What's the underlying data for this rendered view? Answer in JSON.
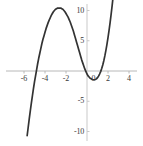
{
  "chart_data": {
    "type": "line",
    "title": "",
    "subtitle": "",
    "xlabel": "",
    "ylabel": "",
    "xlim": [
      -6.6,
      4.6
    ],
    "ylim": [
      -11.0,
      10.9
    ],
    "grid": false,
    "legend": null,
    "axis_style": {
      "x_axis_color": "#b8b8b8",
      "y_axis_color": "#c8c8c8",
      "curve_color": "#333333",
      "tick_label_color": "#3a3a3a",
      "background": "#ffffff"
    },
    "xticks": [
      -6,
      -4,
      -2,
      0,
      2,
      4
    ],
    "xtick_labels": [
      "-6",
      "-4",
      "-2",
      "0",
      "2",
      "4"
    ],
    "yticks": [
      10,
      5,
      0,
      -5,
      -10
    ],
    "ytick_labels": [
      "10",
      "5",
      "0",
      "-5",
      "-10"
    ],
    "origin_label": "0",
    "annotations": [],
    "series": [
      {
        "name": "curve",
        "color": "#333333",
        "linewidth": 1.6,
        "x": [
          -5.7,
          -5.6,
          -5.5,
          -5.4,
          -5.3,
          -5.2,
          -5.1,
          -5.0,
          -4.9,
          -4.8,
          -4.7,
          -4.6,
          -4.5,
          -4.4,
          -4.3,
          -4.2,
          -4.1,
          -4.0,
          -3.9,
          -3.8,
          -3.7,
          -3.6,
          -3.5,
          -3.4,
          -3.3,
          -3.2,
          -3.1,
          -3.0,
          -2.9,
          -2.8,
          -2.7,
          -2.6,
          -2.5,
          -2.4,
          -2.3,
          -2.2,
          -2.1,
          -2.0,
          -1.9,
          -1.8,
          -1.7,
          -1.6,
          -1.5,
          -1.4,
          -1.3,
          -1.2,
          -1.1,
          -1.0,
          -0.9,
          -0.8,
          -0.7,
          -0.6,
          -0.5,
          -0.4,
          -0.3,
          -0.2,
          -0.1,
          0.0,
          0.1,
          0.2,
          0.3,
          0.4,
          0.5,
          0.6,
          0.7,
          0.8,
          0.9,
          1.0,
          1.1,
          1.2,
          1.3,
          1.4,
          1.5,
          1.6,
          1.7,
          1.8,
          1.9,
          2.0,
          2.1,
          2.2,
          2.3,
          2.4,
          2.5,
          2.6,
          2.7,
          2.8,
          2.9,
          3.0,
          3.05
        ],
        "y": [
          -10.7,
          -9.3,
          -7.9,
          -6.6,
          -5.3,
          -4.1,
          -2.9,
          -1.8,
          -0.8,
          0.2,
          1.2,
          2.1,
          2.9,
          3.7,
          4.5,
          5.2,
          5.8,
          6.4,
          7.0,
          7.5,
          8.0,
          8.4,
          8.8,
          9.2,
          9.5,
          9.8,
          10.0,
          10.2,
          10.3,
          10.4,
          10.4,
          10.4,
          10.4,
          10.3,
          10.2,
          10.0,
          9.8,
          9.5,
          9.2,
          8.9,
          8.5,
          8.1,
          7.6,
          7.1,
          6.6,
          6.0,
          5.4,
          4.8,
          4.2,
          3.6,
          3.0,
          2.4,
          1.8,
          1.3,
          0.8,
          0.3,
          -0.1,
          -0.5,
          -0.8,
          -1.0,
          -1.2,
          -1.3,
          -1.4,
          -1.45,
          -1.45,
          -1.4,
          -1.3,
          -1.1,
          -0.85,
          -0.5,
          -0.1,
          0.4,
          1.0,
          1.7,
          2.5,
          3.4,
          4.4,
          5.5,
          6.7,
          8.0,
          9.4,
          10.9,
          12.5,
          14.2,
          16.0,
          17.9,
          19.9,
          22.0,
          23.1
        ]
      }
    ],
    "features": {
      "local_maximum": {
        "x": -2.7,
        "y": 10.4
      },
      "local_minimum": {
        "x": 0.65,
        "y": -1.45
      },
      "x_intercepts": [
        -4.8,
        -0.15,
        1.3
      ]
    }
  },
  "figure": {
    "width_px": 143,
    "height_px": 146,
    "plot_origin_px": {
      "x": 87,
      "y": 71
    },
    "scale_px_per_unit": {
      "x": 10.5,
      "y": 6.05
    }
  }
}
